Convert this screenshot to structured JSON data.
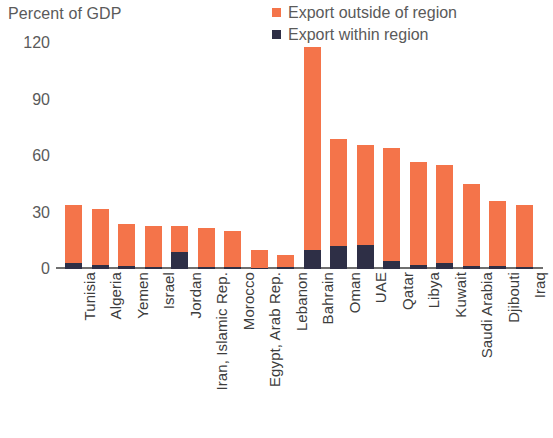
{
  "chart_data": {
    "type": "bar",
    "title": "",
    "subtitle": "",
    "ylabel": "Percent of GDP",
    "xlabel": "",
    "ylim": [
      0,
      120
    ],
    "yticks": [
      0,
      30,
      60,
      90,
      120
    ],
    "ytick_labels": [
      "0",
      "30",
      "60",
      "90",
      "120"
    ],
    "grid": false,
    "stacked": true,
    "legend_position": "top-right",
    "categories": [
      "Tunisia",
      "Algeria",
      "Yemen",
      "Israel",
      "Jordan",
      "Iran, Islamic Rep.",
      "Morocco",
      "Egypt, Arab Rep.",
      "Lebanon",
      "Bahrain",
      "Oman",
      "UAE",
      "Qatar",
      "Libya",
      "Kuwait",
      "Saudi Arabia",
      "Djibouti",
      "Iraq"
    ],
    "series": [
      {
        "name": "Export within region",
        "color": "#2e2f46",
        "values": [
          3,
          2,
          1.5,
          1,
          9,
          1,
          1,
          0.8,
          1,
          10,
          12,
          13,
          4,
          2,
          3,
          1.5,
          1.5,
          1
        ]
      },
      {
        "name": "Export outside of region",
        "color": "#f4744a",
        "values": [
          31,
          30,
          22.5,
          22,
          14,
          21,
          19,
          9.2,
          6.5,
          108,
          57,
          53,
          60.5,
          55,
          52,
          43.5,
          34.5,
          33
        ]
      }
    ],
    "totals": [
      34,
      32,
      24,
      23,
      23,
      22,
      20,
      10,
      7.5,
      118,
      69,
      66,
      64.5,
      57,
      55,
      45,
      36,
      34
    ]
  },
  "legend": {
    "items": [
      {
        "label": "Export outside of region",
        "color": "#f4744a",
        "swatch": "square-swatch"
      },
      {
        "label": "Export within region",
        "color": "#2e2f46",
        "swatch": "square-swatch"
      }
    ]
  },
  "axis": {
    "y_title": "Percent of GDP"
  },
  "colors": {
    "outside_region": "#f4744a",
    "within_region": "#2e2f46",
    "axis_line": "#6f6f6f",
    "text": "#5a5a5a",
    "background": "#ffffff"
  }
}
